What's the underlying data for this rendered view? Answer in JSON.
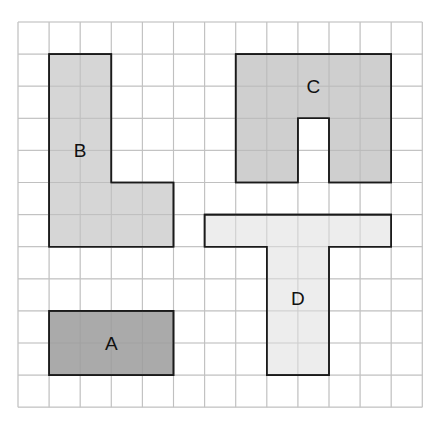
{
  "diagram": {
    "type": "grid-shapes",
    "grid": {
      "columns": 13,
      "rows": 12,
      "origin_x": 18,
      "origin_y": 22,
      "cell_w": 31.1,
      "cell_h": 32.1,
      "line_color": "#d6d6d6",
      "background": "#ffffff"
    },
    "outline_color": "#1a1a1a",
    "shapes": [
      {
        "id": "A",
        "label": "A",
        "fill": "#a3a3a3",
        "cells_polygon": [
          [
            1,
            9
          ],
          [
            5,
            9
          ],
          [
            5,
            11
          ],
          [
            1,
            11
          ]
        ],
        "label_pos": [
          3,
          10
        ]
      },
      {
        "id": "B",
        "label": "B",
        "fill": "#d3d3d3",
        "cells_polygon": [
          [
            1,
            1
          ],
          [
            3,
            1
          ],
          [
            3,
            5
          ],
          [
            5,
            5
          ],
          [
            5,
            7
          ],
          [
            1,
            7
          ]
        ],
        "label_pos": [
          2,
          4
        ]
      },
      {
        "id": "C",
        "label": "C",
        "fill": "#cbcbcb",
        "cells_polygon": [
          [
            7,
            1
          ],
          [
            12,
            1
          ],
          [
            12,
            5
          ],
          [
            10,
            5
          ],
          [
            10,
            3
          ],
          [
            9,
            3
          ],
          [
            9,
            5
          ],
          [
            7,
            5
          ]
        ],
        "label_pos": [
          9.5,
          2
        ]
      },
      {
        "id": "D",
        "label": "D",
        "fill": "#ececec",
        "cells_polygon": [
          [
            6,
            6
          ],
          [
            12,
            6
          ],
          [
            12,
            7
          ],
          [
            10,
            7
          ],
          [
            10,
            11
          ],
          [
            8,
            11
          ],
          [
            8,
            7
          ],
          [
            6,
            7
          ]
        ],
        "label_pos": [
          9,
          8.6
        ]
      }
    ]
  }
}
